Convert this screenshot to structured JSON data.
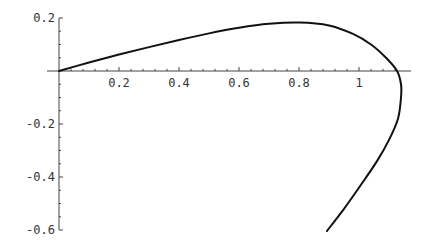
{
  "chart_data": {
    "type": "line",
    "title": "",
    "xlabel": "",
    "ylabel": "",
    "xlim": [
      0,
      1.17
    ],
    "ylim": [
      -0.6,
      0.2
    ],
    "grid": false,
    "legend": null,
    "x_ticks": [
      0.2,
      0.4,
      0.6,
      0.8,
      1.0
    ],
    "x_tick_labels": [
      "0.2",
      "0.4",
      "0.6",
      "0.8",
      "1"
    ],
    "y_ticks": [
      0.2,
      -0.2,
      -0.4,
      -0.6
    ],
    "y_tick_labels": [
      "0.2",
      "-0.2",
      "-0.4",
      "-0.6"
    ],
    "series": [
      {
        "name": "parametric curve",
        "color": "#111111",
        "points": [
          [
            0.0,
            0.0
          ],
          [
            0.1,
            0.032
          ],
          [
            0.2,
            0.062
          ],
          [
            0.3,
            0.09
          ],
          [
            0.4,
            0.117
          ],
          [
            0.5,
            0.142
          ],
          [
            0.6,
            0.163
          ],
          [
            0.7,
            0.178
          ],
          [
            0.8,
            0.183
          ],
          [
            0.9,
            0.172
          ],
          [
            0.98,
            0.14
          ],
          [
            1.04,
            0.1
          ],
          [
            1.09,
            0.05
          ],
          [
            1.127,
            0.0
          ],
          [
            1.14,
            -0.05
          ],
          [
            1.14,
            -0.1
          ],
          [
            1.13,
            -0.18
          ],
          [
            1.1,
            -0.26
          ],
          [
            1.06,
            -0.34
          ],
          [
            1.0,
            -0.44
          ],
          [
            0.95,
            -0.52
          ],
          [
            0.893,
            -0.604
          ]
        ]
      }
    ]
  }
}
